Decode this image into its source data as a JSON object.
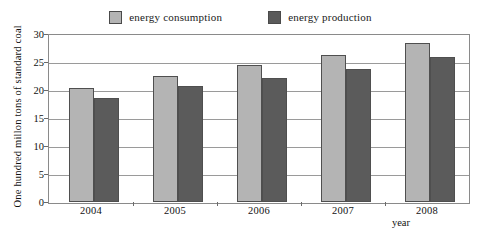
{
  "chart_data": {
    "type": "bar",
    "title": "",
    "subtitle": "",
    "xlabel": "year",
    "ylabel": "One hundred millon tons of standard coal",
    "categories": [
      "2004",
      "2005",
      "2006",
      "2007",
      "2008"
    ],
    "series": [
      {
        "name": "energy consumption",
        "color": "#b4b4b4",
        "values": [
          20.4,
          22.5,
          24.5,
          26.3,
          28.4
        ]
      },
      {
        "name": "energy production",
        "color": "#5b5b5b",
        "values": [
          18.5,
          20.7,
          22.1,
          23.8,
          25.9
        ]
      }
    ],
    "ylim": [
      0,
      30
    ],
    "ytick_values": [
      0,
      5,
      10,
      15,
      20,
      25,
      30
    ],
    "ytick_labels": [
      "0",
      "5",
      "10",
      "15",
      "20",
      "25",
      "30"
    ],
    "grid": true,
    "grid_axis": "y",
    "legend_position": "top-center"
  },
  "legend": {
    "entries": [
      {
        "label": "energy consumption",
        "swatch": "legend-swatch-consumption"
      },
      {
        "label": "energy production",
        "swatch": "legend-swatch-production"
      }
    ]
  },
  "axes": {
    "y_title": "One hundred millon tons of standard coal",
    "x_title": "year",
    "y_ticks": [
      "30",
      "25",
      "20",
      "15",
      "10",
      "5",
      "0"
    ],
    "x_ticks": [
      "2004",
      "2005",
      "2006",
      "2007",
      "2008"
    ]
  },
  "colors": {
    "consumption": "#b4b4b4",
    "production": "#5b5b5b",
    "frame": "#8a8a8a",
    "grid": "#9a9a9a",
    "bar_outline": "#4f4f4f",
    "text": "#111111",
    "background": "#ffffff"
  }
}
